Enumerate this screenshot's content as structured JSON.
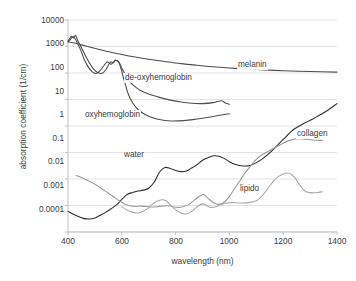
{
  "chart_data": {
    "type": "line",
    "title": "",
    "xlabel": "wavelength (nm)",
    "ylabel": "absorption coefficient (1/cm)",
    "xlim": [
      400,
      1400
    ],
    "ylim": [
      0.0001,
      10000
    ],
    "yscale": "log",
    "xscale": "linear",
    "grid": "horizontal",
    "legend": "inline-annotations",
    "xticks": [
      "400",
      "600",
      "800",
      "1000",
      "1200",
      "1400"
    ],
    "yticks": [
      "10000",
      "1000",
      "100",
      "10",
      "1",
      "0.1",
      "0.01",
      "0.001",
      "0.0001"
    ],
    "annotations": [
      {
        "text": "melanin",
        "x": 1010,
        "y": 75
      },
      {
        "text": "de-oxyhemoglobin",
        "x": 790,
        "y": 28
      },
      {
        "text": "oxyhemoglobin",
        "x": 600,
        "y": 1.5
      },
      {
        "text": "collagen",
        "x": 1300,
        "y": 0.35
      },
      {
        "text": "water",
        "x": 770,
        "y": 0.09
      },
      {
        "text": "lipido",
        "x": 1030,
        "y": 0.006
      }
    ],
    "series": [
      {
        "name": "melanin",
        "color": "#4d4d4d",
        "points": [
          [
            400,
            1500
          ],
          [
            420,
            1380
          ],
          [
            450,
            1150
          ],
          [
            480,
            960
          ],
          [
            520,
            760
          ],
          [
            560,
            610
          ],
          [
            600,
            500
          ],
          [
            650,
            400
          ],
          [
            700,
            330
          ],
          [
            760,
            270
          ],
          [
            820,
            225
          ],
          [
            880,
            195
          ],
          [
            950,
            168
          ],
          [
            1020,
            150
          ],
          [
            1100,
            135
          ],
          [
            1200,
            122
          ],
          [
            1300,
            114
          ],
          [
            1400,
            108
          ]
        ]
      },
      {
        "name": "de-oxyhemoglobin",
        "color": "#4d4d4d",
        "points": [
          [
            400,
            1600
          ],
          [
            412,
            2400
          ],
          [
            420,
            2100
          ],
          [
            428,
            2600
          ],
          [
            436,
            1700
          ],
          [
            450,
            900
          ],
          [
            465,
            450
          ],
          [
            480,
            240
          ],
          [
            495,
            140
          ],
          [
            510,
            105
          ],
          [
            525,
            95
          ],
          [
            540,
            130
          ],
          [
            552,
            215
          ],
          [
            560,
            265
          ],
          [
            568,
            240
          ],
          [
            576,
            300
          ],
          [
            584,
            280
          ],
          [
            592,
            235
          ],
          [
            600,
            150
          ],
          [
            615,
            82
          ],
          [
            630,
            46
          ],
          [
            650,
            30
          ],
          [
            670,
            22
          ],
          [
            700,
            16
          ],
          [
            740,
            12
          ],
          [
            780,
            9.5
          ],
          [
            820,
            8.0
          ],
          [
            860,
            7.2
          ],
          [
            900,
            7.0
          ],
          [
            940,
            7.6
          ],
          [
            970,
            9.0
          ],
          [
            985,
            7.4
          ],
          [
            1000,
            6.6
          ]
        ]
      },
      {
        "name": "oxyhemoglobin",
        "color": "#4d4d4d",
        "points": [
          [
            400,
            1500
          ],
          [
            410,
            1900
          ],
          [
            418,
            2350
          ],
          [
            426,
            2000
          ],
          [
            434,
            1400
          ],
          [
            448,
            700
          ],
          [
            460,
            330
          ],
          [
            475,
            170
          ],
          [
            490,
            110
          ],
          [
            505,
            96
          ],
          [
            520,
            125
          ],
          [
            535,
            200
          ],
          [
            545,
            260
          ],
          [
            552,
            245
          ],
          [
            560,
            215
          ],
          [
            568,
            255
          ],
          [
            576,
            300
          ],
          [
            584,
            290
          ],
          [
            590,
            240
          ],
          [
            597,
            150
          ],
          [
            605,
            72
          ],
          [
            615,
            32
          ],
          [
            625,
            15
          ],
          [
            640,
            7.5
          ],
          [
            660,
            4.2
          ],
          [
            690,
            2.6
          ],
          [
            730,
            1.85
          ],
          [
            780,
            1.55
          ],
          [
            830,
            1.6
          ],
          [
            880,
            1.85
          ],
          [
            930,
            2.2
          ],
          [
            970,
            2.6
          ],
          [
            1000,
            2.9
          ]
        ]
      },
      {
        "name": "water",
        "color": "#2e2e2e",
        "points": [
          [
            400,
            0.0006
          ],
          [
            430,
            0.00042
          ],
          [
            460,
            0.00032
          ],
          [
            480,
            0.00031
          ],
          [
            500,
            0.00034
          ],
          [
            520,
            0.00043
          ],
          [
            540,
            0.00055
          ],
          [
            560,
            0.00075
          ],
          [
            580,
            0.00105
          ],
          [
            600,
            0.0017
          ],
          [
            620,
            0.0026
          ],
          [
            640,
            0.0031
          ],
          [
            660,
            0.0035
          ],
          [
            680,
            0.0038
          ],
          [
            700,
            0.0045
          ],
          [
            720,
            0.0075
          ],
          [
            740,
            0.018
          ],
          [
            760,
            0.027
          ],
          [
            780,
            0.025
          ],
          [
            800,
            0.021
          ],
          [
            820,
            0.019
          ],
          [
            840,
            0.02
          ],
          [
            860,
            0.026
          ],
          [
            880,
            0.035
          ],
          [
            900,
            0.051
          ],
          [
            920,
            0.063
          ],
          [
            940,
            0.075
          ],
          [
            960,
            0.072
          ],
          [
            980,
            0.06
          ],
          [
            1000,
            0.045
          ],
          [
            1020,
            0.036
          ],
          [
            1050,
            0.031
          ],
          [
            1080,
            0.033
          ],
          [
            1120,
            0.055
          ],
          [
            1160,
            0.12
          ],
          [
            1200,
            0.31
          ],
          [
            1240,
            0.75
          ],
          [
            1280,
            1.3
          ],
          [
            1320,
            2.1
          ],
          [
            1360,
            3.6
          ],
          [
            1400,
            7.0
          ]
        ]
      },
      {
        "name": "collagen",
        "color": "#9a9a9a",
        "points": [
          [
            430,
            0.0135
          ],
          [
            450,
            0.0115
          ],
          [
            470,
            0.0092
          ],
          [
            490,
            0.0072
          ],
          [
            510,
            0.0055
          ],
          [
            530,
            0.004
          ],
          [
            550,
            0.0029
          ],
          [
            570,
            0.0021
          ],
          [
            590,
            0.0015
          ],
          [
            610,
            0.00115
          ],
          [
            630,
            0.00098
          ],
          [
            650,
            0.00092
          ],
          [
            670,
            0.00095
          ],
          [
            690,
            0.00092
          ],
          [
            710,
            0.00088
          ],
          [
            730,
            0.0009
          ],
          [
            750,
            0.00095
          ],
          [
            770,
            0.00098
          ],
          [
            790,
            0.0009
          ],
          [
            810,
            0.00085
          ],
          [
            830,
            0.00092
          ],
          [
            850,
            0.0011
          ],
          [
            870,
            0.0016
          ],
          [
            890,
            0.0023
          ],
          [
            905,
            0.0026
          ],
          [
            920,
            0.0019
          ],
          [
            940,
            0.0013
          ],
          [
            960,
            0.0011
          ],
          [
            980,
            0.0013
          ],
          [
            1000,
            0.0022
          ],
          [
            1020,
            0.0045
          ],
          [
            1040,
            0.009
          ],
          [
            1060,
            0.018
          ],
          [
            1080,
            0.032
          ],
          [
            1100,
            0.055
          ],
          [
            1120,
            0.08
          ],
          [
            1140,
            0.105
          ],
          [
            1160,
            0.135
          ],
          [
            1180,
            0.175
          ],
          [
            1200,
            0.225
          ],
          [
            1230,
            0.3
          ],
          [
            1260,
            0.33
          ],
          [
            1290,
            0.31
          ],
          [
            1320,
            0.29
          ],
          [
            1345,
            0.285
          ]
        ]
      },
      {
        "name": "lipido",
        "color": "#a9a9a9",
        "points": [
          [
            600,
            0.00088
          ],
          [
            630,
            0.0006
          ],
          [
            660,
            0.00052
          ],
          [
            690,
            0.0007
          ],
          [
            710,
            0.00105
          ],
          [
            730,
            0.00145
          ],
          [
            750,
            0.00165
          ],
          [
            765,
            0.0015
          ],
          [
            780,
            0.00105
          ],
          [
            800,
            0.0007
          ],
          [
            820,
            0.00052
          ],
          [
            840,
            0.00048
          ],
          [
            860,
            0.0006
          ],
          [
            880,
            0.0009
          ],
          [
            900,
            0.00115
          ],
          [
            915,
            0.001
          ],
          [
            930,
            0.00085
          ],
          [
            950,
            0.0009
          ],
          [
            970,
            0.0011
          ],
          [
            990,
            0.00125
          ],
          [
            1010,
            0.00128
          ],
          [
            1040,
            0.00125
          ],
          [
            1070,
            0.00128
          ],
          [
            1100,
            0.0015
          ],
          [
            1120,
            0.0022
          ],
          [
            1140,
            0.004
          ],
          [
            1160,
            0.0075
          ],
          [
            1180,
            0.012
          ],
          [
            1200,
            0.0155
          ],
          [
            1215,
            0.0168
          ],
          [
            1230,
            0.015
          ],
          [
            1245,
            0.0105
          ],
          [
            1260,
            0.0062
          ],
          [
            1275,
            0.004
          ],
          [
            1290,
            0.0032
          ],
          [
            1310,
            0.003
          ],
          [
            1330,
            0.0031
          ],
          [
            1345,
            0.0033
          ]
        ]
      }
    ]
  }
}
